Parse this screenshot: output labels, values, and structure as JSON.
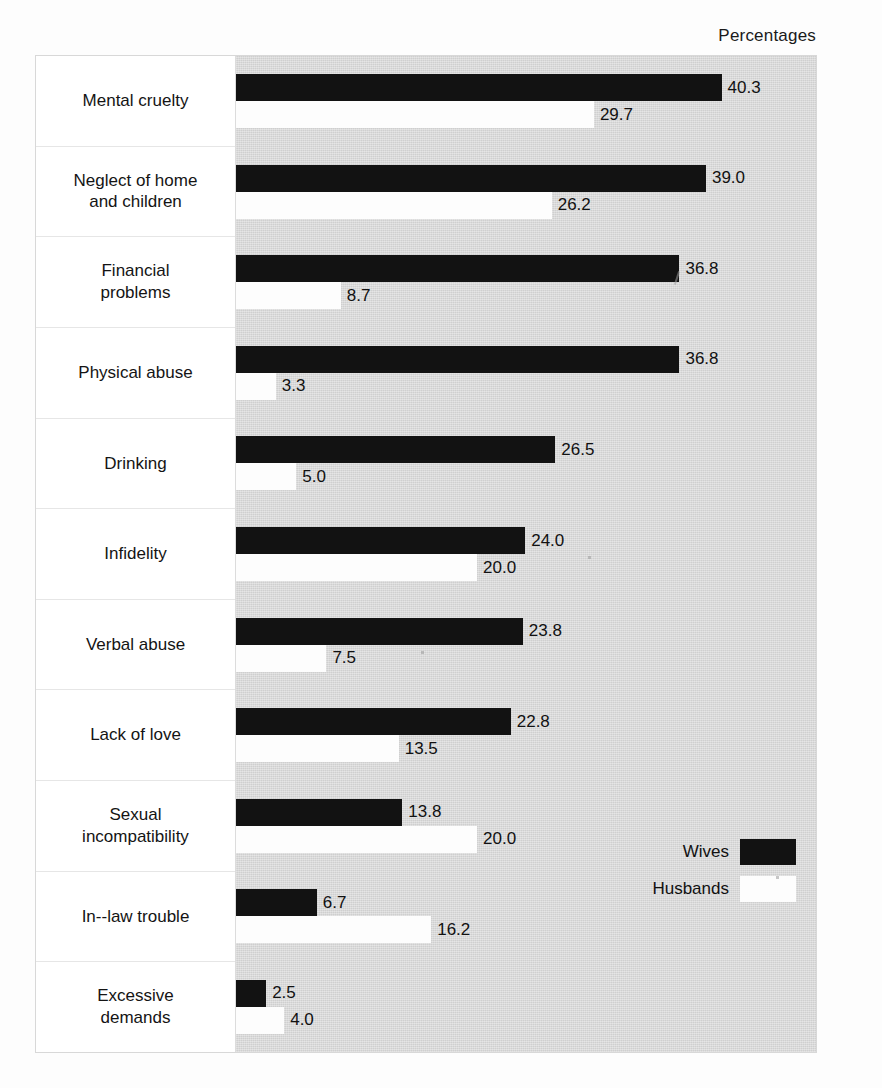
{
  "caption": "Percentages",
  "legend": {
    "items": [
      {
        "label": "Wives",
        "color": "#121212",
        "key": "wives"
      },
      {
        "label": "Husbands",
        "color": "#fdfdfd",
        "key": "husbands"
      }
    ]
  },
  "chart_data": {
    "type": "bar",
    "orientation": "horizontal",
    "title": "",
    "subtitle": "",
    "xlabel": "Percentages",
    "ylabel": "",
    "grid": false,
    "legend_position": "inside-right-lower",
    "xlim": [
      0,
      45
    ],
    "categories": [
      "Mental cruelty",
      "Neglect of home and children",
      "Financial problems",
      "Physical abuse",
      "Drinking",
      "Infidelity",
      "Verbal abuse",
      "Lack of love",
      "Sexual incompatibility",
      "In--law trouble",
      "Excessive demands"
    ],
    "category_lines": [
      [
        "Mental cruelty"
      ],
      [
        "Neglect of home",
        "and children"
      ],
      [
        "Financial",
        "problems"
      ],
      [
        "Physical abuse"
      ],
      [
        "Drinking"
      ],
      [
        "Infidelity"
      ],
      [
        "Verbal abuse"
      ],
      [
        "Lack of love"
      ],
      [
        "Sexual",
        "incompatibility"
      ],
      [
        "In--law trouble"
      ],
      [
        "Excessive",
        "demands"
      ]
    ],
    "series": [
      {
        "name": "Wives",
        "color": "#121212",
        "values": [
          40.3,
          39.0,
          36.8,
          36.8,
          26.5,
          24.0,
          23.8,
          22.8,
          13.8,
          6.7,
          2.5
        ],
        "labels": [
          "40.3",
          "39.0",
          "36.8",
          "36.8",
          "26.5",
          "24.0",
          "23.8",
          "22.8",
          "13.8",
          "6.7",
          "2.5"
        ]
      },
      {
        "name": "Husbands",
        "color": "#fdfdfd",
        "values": [
          29.7,
          26.2,
          8.7,
          3.3,
          5.0,
          20.0,
          7.5,
          13.5,
          20.0,
          16.2,
          4.0
        ],
        "labels": [
          "29.7",
          "26.2",
          "8.7",
          "3.3",
          "5.0",
          "20.0",
          "7.5",
          "13.5",
          "20.0",
          "16.2",
          "4.0"
        ]
      }
    ]
  }
}
